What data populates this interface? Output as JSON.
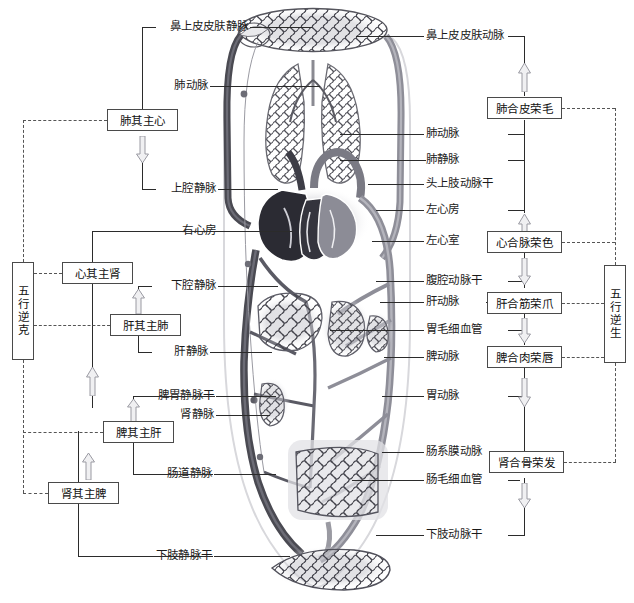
{
  "diagram": {
    "colors": {
      "vein_dark": "#4a4a52",
      "artery_gray": "#8e8e96",
      "line": "#2b2b2b",
      "dash": "#555555",
      "box_border": "#4a4a4a"
    }
  },
  "left_vertical_box": {
    "label": "五行逆克"
  },
  "right_vertical_box": {
    "label": "五行逆生"
  },
  "left_labels": [
    {
      "id": "nasal-skin-vein",
      "text": "鼻上皮皮肤静脉"
    },
    {
      "id": "pulmonary-artery-l",
      "text": "肺动脉"
    },
    {
      "id": "superior-vena-cava",
      "text": "上腔静脉"
    },
    {
      "id": "right-atrium",
      "text": "右心房"
    },
    {
      "id": "inferior-vena-cava",
      "text": "下腔静脉"
    },
    {
      "id": "hepatic-vein",
      "text": "肝静脉"
    },
    {
      "id": "splenogastric-vein-trunk",
      "text": "脾胃静脉干"
    },
    {
      "id": "renal-vein",
      "text": "肾静脉"
    },
    {
      "id": "intestinal-vein",
      "text": "肠道静脉"
    },
    {
      "id": "lower-limb-vein-trunk",
      "text": "下肢静脉干"
    }
  ],
  "left_boxes": [
    {
      "id": "lung-governs-heart",
      "text": "肺其主心"
    },
    {
      "id": "heart-governs-kidney",
      "text": "心其主肾"
    },
    {
      "id": "liver-governs-lung",
      "text": "肝其主肺"
    },
    {
      "id": "spleen-governs-liver",
      "text": "脾其主肝"
    },
    {
      "id": "kidney-governs-spleen",
      "text": "肾其主脾"
    }
  ],
  "right_labels": [
    {
      "id": "nasal-skin-artery",
      "text": "鼻上皮皮肤动脉"
    },
    {
      "id": "pulmonary-artery-r",
      "text": "肺动脉"
    },
    {
      "id": "pulmonary-vein",
      "text": "肺静脉"
    },
    {
      "id": "head-upper-limb-artery-trunk",
      "text": "头上肢动脉干"
    },
    {
      "id": "left-atrium",
      "text": "左心房"
    },
    {
      "id": "left-ventricle",
      "text": "左心室"
    },
    {
      "id": "celiac-artery-trunk",
      "text": "腹腔动脉干"
    },
    {
      "id": "hepatic-artery",
      "text": "肝动脉"
    },
    {
      "id": "gastric-capillary",
      "text": "胃毛细血管"
    },
    {
      "id": "splenic-artery",
      "text": "脾动脉"
    },
    {
      "id": "gastric-artery",
      "text": "胃动脉"
    },
    {
      "id": "mesenteric-artery",
      "text": "肠系膜动脉"
    },
    {
      "id": "intestinal-capillary",
      "text": "肠毛细血管"
    },
    {
      "id": "lower-limb-artery-trunk",
      "text": "下肢动脉干"
    }
  ],
  "right_boxes": [
    {
      "id": "lung-pairs-skin",
      "text": "肺合皮荣毛"
    },
    {
      "id": "heart-pairs-vessels",
      "text": "心合脉荣色"
    },
    {
      "id": "liver-pairs-tendons",
      "text": "肝合筋荣爪"
    },
    {
      "id": "spleen-pairs-flesh",
      "text": "脾合肉荣唇"
    },
    {
      "id": "kidney-pairs-bone",
      "text": "肾合骨荣发"
    }
  ],
  "anatomy_parts": [
    {
      "id": "head-capillary-network",
      "name": "head-capillary-network"
    },
    {
      "id": "lungs",
      "name": "lungs"
    },
    {
      "id": "heart",
      "name": "heart"
    },
    {
      "id": "liver",
      "name": "liver"
    },
    {
      "id": "stomach",
      "name": "stomach"
    },
    {
      "id": "spleen",
      "name": "spleen"
    },
    {
      "id": "kidney",
      "name": "kidney"
    },
    {
      "id": "intestine-capillary-network",
      "name": "intestine-capillary-network"
    },
    {
      "id": "lower-limb-capillary-network",
      "name": "lower-limb-capillary-network"
    }
  ]
}
